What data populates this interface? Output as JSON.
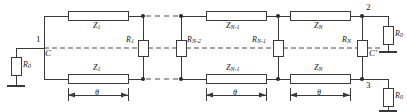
{
  "figure": {
    "type": "circuit-schematic",
    "colors": {
      "line": "#3a3a3a",
      "label": "#1a1a1a",
      "background": "#ffffff",
      "component_fill": "#ffffff"
    }
  },
  "nodes": {
    "input": "1",
    "output_top": "2",
    "output_bottom": "3"
  },
  "symmetry_labels": {
    "left": "C",
    "right": "C'"
  },
  "series_top": [
    {
      "label": "Z",
      "sub": "1"
    },
    {
      "label": "Z",
      "sub": "N-1"
    },
    {
      "label": "Z",
      "sub": "N"
    }
  ],
  "series_bottom": [
    {
      "label": "Z",
      "sub": "1"
    },
    {
      "label": "Z",
      "sub": "N-1"
    },
    {
      "label": "Z",
      "sub": "N"
    }
  ],
  "shunt_resistors": [
    {
      "label": "R",
      "sub": "1"
    },
    {
      "label": "R",
      "sub": "N-2"
    },
    {
      "label": "R",
      "sub": "N-1"
    },
    {
      "label": "R",
      "sub": "N"
    }
  ],
  "terminations": [
    {
      "label": "R",
      "sub": "0",
      "position": "left-source"
    },
    {
      "label": "R",
      "sub": "0",
      "position": "right-top"
    },
    {
      "label": "R",
      "sub": "0",
      "position": "right-bottom"
    }
  ],
  "dimensions": [
    {
      "label": "θ"
    },
    {
      "label": "θ"
    },
    {
      "label": "θ"
    }
  ],
  "ellipsis": {
    "style": "dashed",
    "meaning": "repeated sections omitted"
  }
}
